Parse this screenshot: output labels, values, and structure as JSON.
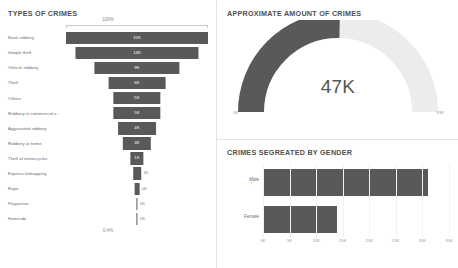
{
  "funnel": {
    "title": "TYPES OF CRIMES",
    "top_label": "100%",
    "bottom_label": "0.4%",
    "max_value": 15000,
    "rows": [
      {
        "label": "Bank robbery",
        "value_label": "15K",
        "value": 15000
      },
      {
        "label": "Simple theft",
        "value_label": "13K",
        "value": 13000
      },
      {
        "label": "Vehicle robbery",
        "value_label": "9K",
        "value": 9000
      },
      {
        "label": "Theft",
        "value_label": "6K",
        "value": 6000
      },
      {
        "label": "Others",
        "value_label": "5K",
        "value": 5000
      },
      {
        "label": "Robbery in commercial a...",
        "value_label": "5K",
        "value": 5000
      },
      {
        "label": "Aggravated robbery",
        "value_label": "4K",
        "value": 4000
      },
      {
        "label": "Robbery at home",
        "value_label": "3K",
        "value": 3000
      },
      {
        "label": "Theft of motorcycles",
        "value_label": "1K",
        "value": 1400
      },
      {
        "label": "Express kidnapping",
        "value_label": "1K",
        "value": 800
      },
      {
        "label": "Rape",
        "value_label": "0K",
        "value": 500
      },
      {
        "label": "Plagiarism",
        "value_label": "0K",
        "value": 90
      },
      {
        "label": "Homicide",
        "value_label": "0K",
        "value": 60
      }
    ]
  },
  "gauge": {
    "title": "APPROXIMATE AMOUNT OF CRIMES",
    "value_label": "47K",
    "value": 47000,
    "min_label": "0K",
    "max_label": "93K",
    "min": 0,
    "max": 93000,
    "fill_color": "#595959",
    "track_color": "#ececec"
  },
  "gender": {
    "title": "CRIMES SEGREATED BY GENDER",
    "bar_color": "#595959",
    "axis_max": 35000,
    "axis_ticks": [
      "0K",
      "5K",
      "10K",
      "15K",
      "20K",
      "25K",
      "30K",
      "35K"
    ],
    "stray_tick": "7",
    "categories": [
      {
        "label": "Male",
        "value": 31000
      },
      {
        "label": "Female",
        "value": 14000
      }
    ]
  },
  "chart_data": [
    {
      "type": "bar",
      "subtype": "funnel",
      "title": "TYPES OF CRIMES",
      "xlabel": "",
      "ylabel": "",
      "categories": [
        "Bank robbery",
        "Simple theft",
        "Vehicle robbery",
        "Theft",
        "Others",
        "Robbery in commercial a...",
        "Aggravated robbery",
        "Robbery at home",
        "Theft of motorcycles",
        "Express kidnapping",
        "Rape",
        "Plagiarism",
        "Homicide"
      ],
      "values": [
        15000,
        13000,
        9000,
        6000,
        5000,
        5000,
        4000,
        3000,
        1400,
        800,
        500,
        90,
        60
      ],
      "data_labels": [
        "15K",
        "13K",
        "9K",
        "6K",
        "5K",
        "5K",
        "4K",
        "3K",
        "1K",
        "1K",
        "0K",
        "0K",
        "0K"
      ],
      "annotations": [
        "100%",
        "0.4%"
      ],
      "grid": false,
      "legend": "none"
    },
    {
      "type": "pie",
      "subtype": "gauge",
      "title": "APPROXIMATE AMOUNT OF CRIMES",
      "values": [
        47000,
        46000
      ],
      "labels": [
        "Crimes",
        "Remaining"
      ],
      "value_label": "47K",
      "axis_range": [
        0,
        93000
      ],
      "tick_labels": [
        "0K",
        "93K"
      ],
      "grid": false,
      "legend": "none"
    },
    {
      "type": "bar",
      "subtype": "horizontal",
      "title": "CRIMES SEGREATED BY GENDER",
      "categories": [
        "Male",
        "Female"
      ],
      "values": [
        31000,
        14000
      ],
      "xlabel": "",
      "ylabel": "",
      "xlim": [
        0,
        35000
      ],
      "tick_labels": [
        "0K",
        "5K",
        "10K",
        "15K",
        "20K",
        "25K",
        "30K",
        "35K"
      ],
      "grid": true,
      "legend": "none"
    }
  ]
}
